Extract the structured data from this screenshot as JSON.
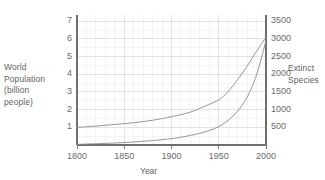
{
  "chart_data": {
    "type": "line",
    "title": "",
    "xlabel": "Year",
    "ylabel": "World Population (billion people)",
    "y2label": "Extinct Species",
    "grid": true,
    "legend": "none",
    "xlim": [
      1800,
      2000
    ],
    "ylim": [
      0,
      7.35
    ],
    "y2lim": [
      0,
      3675
    ],
    "xticks": [
      1800,
      1850,
      1900,
      1950,
      2000
    ],
    "xticklabels": [
      "1800",
      "1850",
      "1900",
      "1950",
      "2000"
    ],
    "yticks": [
      1,
      2,
      3,
      4,
      5,
      6,
      7
    ],
    "yticklabels": [
      "1",
      "2",
      "3",
      "4",
      "5",
      "6",
      "7"
    ],
    "y2ticks": [
      500,
      1000,
      1500,
      2000,
      2500,
      3000,
      3500
    ],
    "y2ticklabels": [
      "500",
      "1000",
      "1500",
      "2000",
      "2500",
      "3000",
      "3500"
    ],
    "x_minor_step": 10,
    "y_minor_step": 0.5,
    "series": [
      {
        "name": "World Population",
        "axis": "left",
        "color": "#8a8a8a",
        "x": [
          1800,
          1820,
          1840,
          1860,
          1880,
          1900,
          1910,
          1920,
          1930,
          1940,
          1950,
          1960,
          1970,
          1980,
          1990,
          2000
        ],
        "values": [
          1.0,
          1.07,
          1.16,
          1.26,
          1.4,
          1.6,
          1.72,
          1.86,
          2.07,
          2.3,
          2.55,
          3.03,
          3.7,
          4.45,
          5.3,
          6.1
        ]
      },
      {
        "name": "Extinct Species",
        "axis": "right",
        "color": "#8a8a8a",
        "x": [
          1800,
          1820,
          1840,
          1860,
          1880,
          1900,
          1910,
          1920,
          1930,
          1940,
          1950,
          1960,
          1970,
          1980,
          1990,
          2000
        ],
        "values": [
          20,
          35,
          55,
          85,
          125,
          180,
          220,
          270,
          330,
          410,
          520,
          700,
          960,
          1350,
          1980,
          2950
        ]
      }
    ]
  },
  "axes": {
    "left": {
      "title": "World\nPopulation\n(billion\npeople)",
      "ticks": [
        "7",
        "6",
        "5",
        "4",
        "3",
        "2",
        "1"
      ]
    },
    "right": {
      "title": "Extinct\nSpecies",
      "ticks": [
        "3500",
        "3000",
        "2500",
        "2000",
        "1500",
        "1000",
        "500"
      ]
    },
    "bottom": {
      "title": "Year",
      "ticks": [
        "1800",
        "1850",
        "1900",
        "1950",
        "2000"
      ]
    }
  },
  "colors": {
    "background": "#ffffff",
    "axis_line": "#6f6f6f",
    "grid_major": "#dcdcdc",
    "grid_minor": "#ececec",
    "curve": "#8a8a8a",
    "text": "#5f5f5f"
  }
}
